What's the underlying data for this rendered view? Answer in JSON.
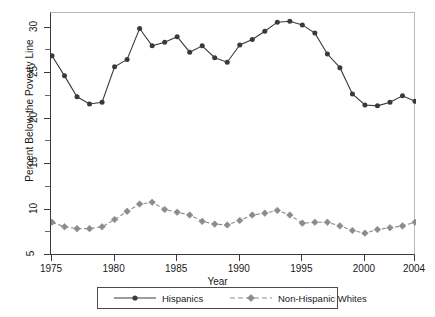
{
  "chart_data": {
    "type": "line",
    "title": "",
    "xlabel": "Year",
    "ylabel": "Percent Below the Poverty Line",
    "xlim": [
      1975,
      2004
    ],
    "ylim": [
      5,
      31.5
    ],
    "xticks": [
      1975,
      1980,
      1985,
      1990,
      1995,
      2000,
      2004
    ],
    "yticks": [
      5,
      10,
      15,
      20,
      25,
      30
    ],
    "yticks_minor": [
      7.5,
      12.5,
      17.5,
      22.5,
      27.5
    ],
    "grid": false,
    "legend_position": "below-axes",
    "x": [
      1975,
      1976,
      1977,
      1978,
      1979,
      1980,
      1981,
      1982,
      1983,
      1984,
      1985,
      1986,
      1987,
      1988,
      1989,
      1990,
      1991,
      1992,
      1993,
      1994,
      1995,
      1996,
      1997,
      1998,
      1999,
      2000,
      2001,
      2002,
      2003,
      2004
    ],
    "series": [
      {
        "name": "Hispanics",
        "marker": "circle",
        "linestyle": "solid",
        "color": "#3a3a3a",
        "values": [
          26.9,
          24.7,
          22.4,
          21.6,
          21.8,
          25.7,
          26.5,
          29.9,
          28.0,
          28.4,
          29.0,
          27.3,
          28.0,
          26.7,
          26.2,
          28.1,
          28.7,
          29.6,
          30.6,
          30.7,
          30.3,
          29.4,
          27.1,
          25.6,
          22.7,
          21.5,
          21.4,
          21.8,
          22.5,
          21.9
        ]
      },
      {
        "name": "Non-Hispanic Whites",
        "marker": "diamond",
        "linestyle": "dashed",
        "color": "#8c8c8c",
        "values": [
          8.6,
          8.1,
          7.9,
          7.9,
          8.1,
          8.9,
          9.8,
          10.6,
          10.8,
          10.0,
          9.7,
          9.4,
          8.7,
          8.4,
          8.3,
          8.8,
          9.4,
          9.6,
          9.9,
          9.4,
          8.5,
          8.6,
          8.6,
          8.2,
          7.7,
          7.4,
          7.8,
          8.0,
          8.2,
          8.6
        ]
      }
    ]
  },
  "axes": {
    "ylabel": "Percent Below the Poverty Line",
    "xlabel": "Year",
    "ytick_labels": [
      "5",
      "10",
      "15",
      "20",
      "25",
      "30"
    ],
    "xtick_labels": [
      "1975",
      "1980",
      "1985",
      "1990",
      "1995",
      "2000",
      "2004"
    ]
  },
  "legend": {
    "entries": [
      {
        "label": "Hispanics"
      },
      {
        "label": "Non-Hispanic Whites"
      }
    ]
  },
  "colors": {
    "hispanics": "#3a3a3a",
    "whites": "#8c8c8c",
    "frame": "#b9b9b9",
    "axis": "#3a3a3a"
  }
}
